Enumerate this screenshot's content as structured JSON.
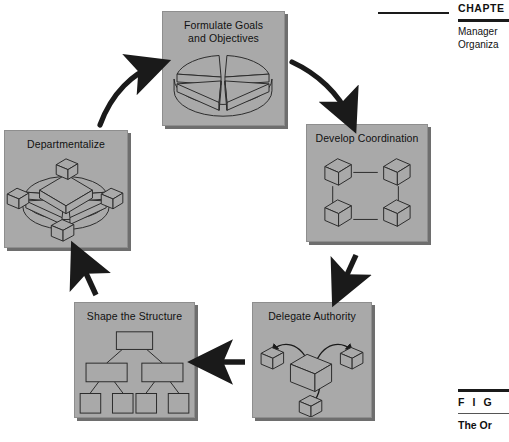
{
  "figure": {
    "type": "cycle-diagram",
    "background": "#ffffff",
    "panel_fill": "#a9a9a9",
    "panel_shadow": "#6e6e6e",
    "stroke": "#1a1a1a",
    "steps": [
      {
        "id": "goals",
        "label": "Formulate Goals\nand Objectives",
        "art": "segmented-disc"
      },
      {
        "id": "coord",
        "label": "Develop Coordination",
        "art": "four-cubes-square"
      },
      {
        "id": "delegate",
        "label": "Delegate Authority",
        "art": "cubes-with-arrows"
      },
      {
        "id": "structure",
        "label": "Shape the Structure",
        "art": "org-chart-tree"
      },
      {
        "id": "depart",
        "label": "Departmentalize",
        "art": "disc-with-cubes"
      }
    ],
    "connectors": [
      {
        "from": "depart",
        "to": "goals",
        "shape": "curve",
        "direction": "up-right"
      },
      {
        "from": "goals",
        "to": "coord",
        "shape": "curve",
        "direction": "down-right"
      },
      {
        "from": "coord",
        "to": "delegate",
        "shape": "straight",
        "direction": "down"
      },
      {
        "from": "delegate",
        "to": "structure",
        "shape": "straight",
        "direction": "left"
      },
      {
        "from": "structure",
        "to": "depart",
        "shape": "straight",
        "direction": "up"
      }
    ]
  },
  "margin": {
    "chapter_word": "CHAPTE",
    "chapter_subtitle": "Manager\nOrganiza",
    "figure_word": "F I G",
    "figure_title": "The Or"
  }
}
